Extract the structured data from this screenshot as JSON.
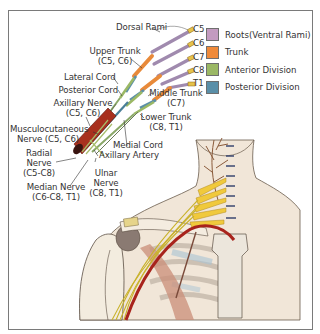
{
  "figure": {
    "legend": [
      {
        "label": "Roots(Ventral Rami)",
        "color": "#c39bc0"
      },
      {
        "label": "Trunk",
        "color": "#ef8a3a"
      },
      {
        "label": "Anterior Division",
        "color": "#9bb865"
      },
      {
        "label": "Posterior Division",
        "color": "#5a8fa8"
      }
    ],
    "root_labels": [
      "C5",
      "C6",
      "C7",
      "C8",
      "T1"
    ],
    "labels": {
      "dorsal_rami": "Dorsal Rami",
      "upper_trunk_1": "Upper Trunk",
      "upper_trunk_2": "(C5, C6)",
      "lateral_cord": "Lateral Cord",
      "posterior_cord": "Posterior Cord",
      "axillary_nerve_1": "Axillary Nerve",
      "axillary_nerve_2": "(C5, C6)",
      "middle_trunk_1": "Middle Trunk",
      "middle_trunk_2": "(C7)",
      "lower_trunk_1": "Lower Trunk",
      "lower_trunk_2": "(C8, T1)",
      "musculocutaneous_1": "Musculocutaneous",
      "musculocutaneous_2": "Nerve (C5, C6)",
      "medial_cord": "Medial Cord",
      "radial_1": "Radial",
      "radial_2": "Nerve",
      "radial_3": "(C5-C8)",
      "axillary_artery": "Axillary Artery",
      "ulnar_1": "Ulnar",
      "ulnar_2": "Nerve",
      "ulnar_3": "(C8, T1)",
      "median_1": "Median Nerve",
      "median_2": "(C6-C8, T1)"
    }
  }
}
